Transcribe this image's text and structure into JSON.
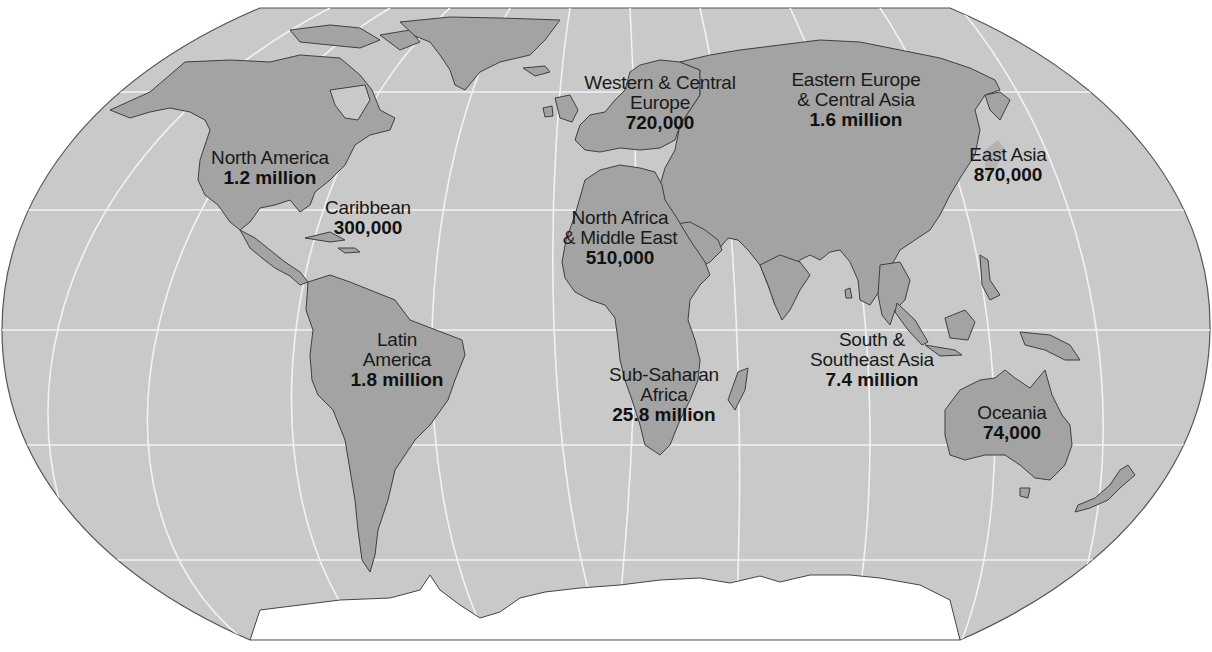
{
  "map": {
    "projection": "robinson",
    "colors": {
      "ocean": "#c9c9c9",
      "land": "#a3a3a3",
      "land_border": "#4a4a4a",
      "graticule": "#f4f4f4",
      "antarctica": "#ffffff",
      "outline": "#555555"
    },
    "regions": [
      {
        "name": "North America",
        "value": "1.2 million",
        "x": 270,
        "y": 148
      },
      {
        "name": "Caribbean",
        "value": "300,000",
        "x": 368,
        "y": 198
      },
      {
        "name": "Latin America",
        "name_lines": [
          "Latin",
          "America"
        ],
        "value": "1.8 million",
        "x": 397,
        "y": 330
      },
      {
        "name": "Western & Central Europe",
        "name_lines": [
          "Western & Central",
          "Europe"
        ],
        "value": "720,000",
        "x": 660,
        "y": 73
      },
      {
        "name": "Eastern Europe & Central Asia",
        "name_lines": [
          "Eastern Europe",
          "& Central Asia"
        ],
        "value": "1.6 million",
        "x": 856,
        "y": 70
      },
      {
        "name": "East Asia",
        "value": "870,000",
        "x": 1008,
        "y": 145
      },
      {
        "name": "North Africa & Middle East",
        "name_lines": [
          "North Africa",
          "& Middle East"
        ],
        "value": "510,000",
        "x": 620,
        "y": 208
      },
      {
        "name": "Sub-Saharan Africa",
        "name_lines": [
          "Sub-Saharan",
          "Africa"
        ],
        "value": "25.8 million",
        "x": 664,
        "y": 365
      },
      {
        "name": "South & Southeast Asia",
        "name_lines": [
          "South &",
          "Southeast Asia"
        ],
        "value": "7.4 million",
        "x": 872,
        "y": 330
      },
      {
        "name": "Oceania",
        "value": "74,000",
        "x": 1012,
        "y": 403
      }
    ]
  }
}
